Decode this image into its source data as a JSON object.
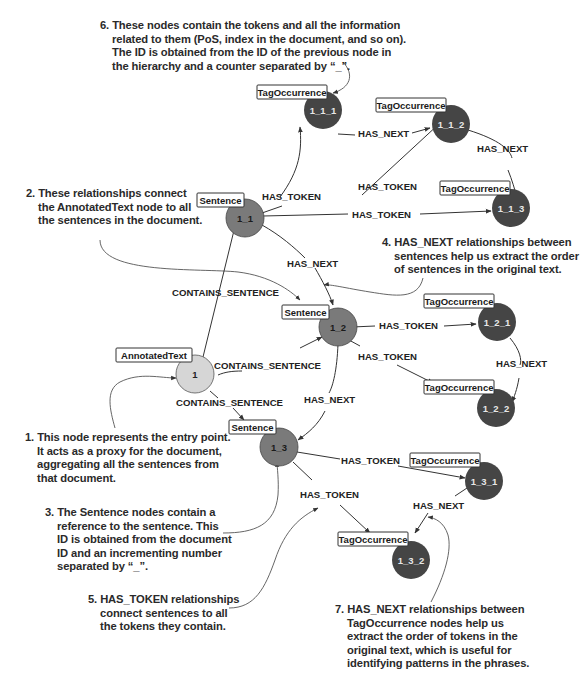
{
  "colors": {
    "annotated_text_fill": "#d6d6d6",
    "sentence_fill": "#7a7a7a",
    "tag_occurrence_fill": "#454545",
    "edge": "#333333",
    "annotation_text": "#2a2a2a",
    "background": "#ffffff"
  },
  "nodes": {
    "annotated_text": {
      "label": "AnnotatedText",
      "id": "1"
    },
    "sentence_1_1": {
      "label": "Sentence",
      "id": "1_1"
    },
    "sentence_1_2": {
      "label": "Sentence",
      "id": "1_2"
    },
    "sentence_1_3": {
      "label": "Sentence",
      "id": "1_3"
    },
    "tag_1_1_1": {
      "label": "TagOccurrence",
      "id": "1_1_1"
    },
    "tag_1_1_2": {
      "label": "TagOccurrence",
      "id": "1_1_2"
    },
    "tag_1_1_3": {
      "label": "TagOccurrence",
      "id": "1_1_3"
    },
    "tag_1_2_1": {
      "label": "TagOccurrence",
      "id": "1_2_1"
    },
    "tag_1_2_2": {
      "label": "TagOccurrence",
      "id": "1_2_2"
    },
    "tag_1_3_1": {
      "label": "TagOccurrence",
      "id": "1_3_1"
    },
    "tag_1_3_2": {
      "label": "TagOccurrence",
      "id": "1_3_2"
    }
  },
  "relationships": {
    "contains_sentence_1": "CONTAINS_SENTENCE",
    "contains_sentence_2": "CONTAINS_SENTENCE",
    "contains_sentence_3": "CONTAINS_SENTENCE",
    "has_token_1_1_1": "HAS_TOKEN",
    "has_token_1_1_2": "HAS_TOKEN",
    "has_token_1_1_3": "HAS_TOKEN",
    "has_next_1_1_1": "HAS_NEXT",
    "has_next_1_1_2": "HAS_NEXT",
    "has_next_s1": "HAS_NEXT",
    "has_token_1_2_1": "HAS_TOKEN",
    "has_token_1_2_2": "HAS_TOKEN",
    "has_next_1_2_1": "HAS_NEXT",
    "has_next_s2": "HAS_NEXT",
    "has_token_1_3_1": "HAS_TOKEN",
    "has_token_1_3_2": "HAS_TOKEN",
    "has_next_1_3_1": "HAS_NEXT"
  },
  "annotations": {
    "note1": "1. This node represents the entry point.\n    It acts as a proxy for the document,\n    aggregating all the sentences from\n    that document.",
    "note2": "2. These relationships connect\n    the AnnotatedText node to all\n    the sentences in the document.",
    "note3": "3. The Sentence nodes contain a\n    reference to the sentence. This\n    ID is obtained from the document\n    ID and an incrementing number\n    separated by “_”.",
    "note4": "4. HAS_NEXT relationships between\n    sentences help us extract the order\n    of sentences in the original text.",
    "note5": "5. HAS_TOKEN relationships\n    connect sentences to all\n    the tokens they contain.",
    "note6": "6. These nodes contain the tokens and all the information\n    related to them (PoS, index in the document, and so on).\n    The ID is obtained from the ID of the previous node in\n    the hierarchy and a counter separated by “_”.",
    "note7": "7. HAS_NEXT relationships between\n    TagOccurrence nodes help us\n    extract the order of tokens in the\n    original text, which is useful for\n    identifying patterns in the phrases."
  }
}
